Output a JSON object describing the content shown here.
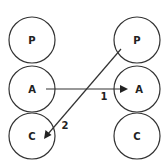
{
  "diagram": {
    "type": "transactional-analysis-crossed-transaction",
    "stroke_color": "#333333",
    "text_color": "#222222",
    "left_person": {
      "states": [
        {
          "label": "P",
          "cx": 32,
          "cy": 40,
          "r": 23
        },
        {
          "label": "A",
          "cx": 32,
          "cy": 89,
          "r": 23
        },
        {
          "label": "C",
          "cx": 32,
          "cy": 136,
          "r": 23
        }
      ]
    },
    "right_person": {
      "states": [
        {
          "label": "P",
          "cx": 137,
          "cy": 40,
          "r": 23
        },
        {
          "label": "A",
          "cx": 137,
          "cy": 89,
          "r": 23
        },
        {
          "label": "C",
          "cx": 137,
          "cy": 136,
          "r": 23
        }
      ]
    },
    "transactions": [
      {
        "label": "1",
        "from": "left A",
        "to": "right A",
        "x1": 46,
        "y1": 89,
        "x2": 127,
        "y2": 89,
        "label_x": 104,
        "label_y": 100
      },
      {
        "label": "2",
        "from": "right P",
        "to": "left C",
        "x1": 121,
        "y1": 49,
        "x2": 44,
        "y2": 139,
        "label_x": 63,
        "label_y": 129
      }
    ]
  }
}
